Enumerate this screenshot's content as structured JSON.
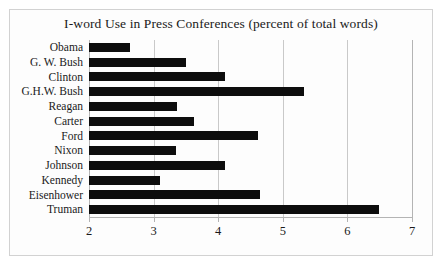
{
  "chart_data": {
    "type": "bar",
    "orientation": "horizontal",
    "title": "I-word Use in Press Conferences (percent of total words)",
    "xlabel": "",
    "ylabel": "",
    "xlim": [
      2,
      7
    ],
    "xticks": [
      "2",
      "3",
      "4",
      "5",
      "6",
      "7"
    ],
    "grid": true,
    "legend": "none",
    "bar_color": "#0d0d0d",
    "categories": [
      "Obama",
      "G. W. Bush",
      "Clinton",
      "G.H.W. Bush",
      "Reagan",
      "Carter",
      "Ford",
      "Nixon",
      "Johnson",
      "Kennedy",
      "Eisenhower",
      "Truman"
    ],
    "values": [
      2.63,
      3.5,
      4.1,
      5.33,
      3.36,
      3.62,
      4.62,
      3.35,
      4.1,
      3.1,
      4.65,
      6.49
    ]
  },
  "style": {
    "border_color": "#d2d2d2",
    "grid_color": "#c9c9c9",
    "text_color": "#1a1a1a",
    "background": "#fdfdfd"
  }
}
